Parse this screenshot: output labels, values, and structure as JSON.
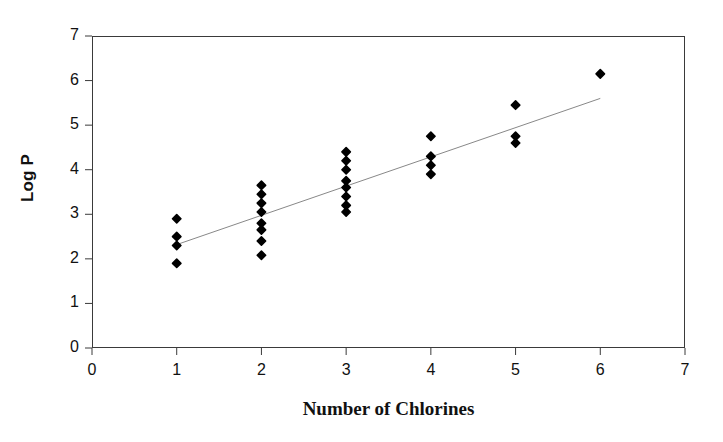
{
  "chart_data": {
    "type": "scatter",
    "title": "",
    "subtitle": "",
    "xlabel": "Number of Chlorines",
    "ylabel": "Log P",
    "xlim": [
      0,
      7
    ],
    "ylim": [
      0,
      7
    ],
    "xticks": [
      0,
      1,
      2,
      3,
      4,
      5,
      6,
      7
    ],
    "yticks": [
      0,
      1,
      2,
      3,
      4,
      5,
      6,
      7
    ],
    "xtick_labels": [
      "0",
      "1",
      "2",
      "3",
      "4",
      "5",
      "6",
      "7"
    ],
    "ytick_labels": [
      "0",
      "1",
      "2",
      "3",
      "4",
      "5",
      "6",
      "7"
    ],
    "grid": false,
    "legend": null,
    "legend_position": "none",
    "marker": "diamond",
    "marker_color": "#000000",
    "marker_size": 6,
    "series": [
      {
        "name": "Log P vs Number of Chlorines",
        "x": [
          1,
          1,
          1,
          1,
          2,
          2,
          2,
          2,
          2,
          2,
          2,
          2,
          3,
          3,
          3,
          3,
          3,
          3,
          3,
          3,
          4,
          4,
          4,
          4,
          5,
          5,
          5,
          6
        ],
        "y": [
          2.9,
          2.5,
          2.3,
          1.9,
          3.65,
          3.45,
          3.25,
          3.05,
          2.8,
          2.65,
          2.4,
          2.08,
          4.4,
          4.2,
          4.0,
          3.75,
          3.6,
          3.4,
          3.2,
          3.05,
          4.75,
          4.3,
          4.1,
          3.9,
          5.45,
          4.75,
          4.6,
          6.15
        ]
      }
    ],
    "trendline": {
      "type": "linear",
      "color": "#888888",
      "width": 1,
      "x_start": 1.0,
      "y_start": 2.32,
      "x_end": 6.0,
      "y_end": 5.6
    }
  },
  "axes": {
    "y_title": "Log P",
    "x_title": "Number of Chlorines"
  }
}
